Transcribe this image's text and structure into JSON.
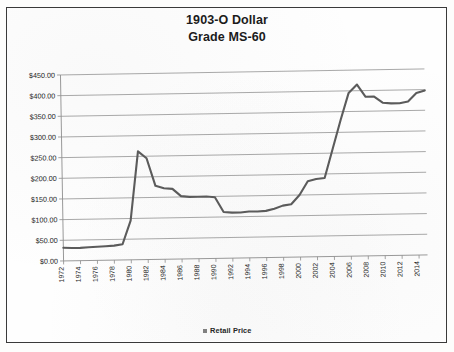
{
  "chart_data": {
    "type": "line",
    "title": "1903-O Dollar",
    "subtitle": "Grade MS-60",
    "xlabel": "",
    "ylabel": "",
    "ylim": [
      0,
      450
    ],
    "ytick_labels": [
      "$0.00",
      "$50.00",
      "$100.00",
      "$150.00",
      "$200.00",
      "$250.00",
      "$300.00",
      "$350.00",
      "$400.00",
      "$450.00"
    ],
    "ytick_values": [
      0,
      50,
      100,
      150,
      200,
      250,
      300,
      350,
      400,
      450
    ],
    "grid": true,
    "legend_position": "bottom",
    "xtick_labels": [
      "1972",
      "1974",
      "1976",
      "1978",
      "1980",
      "1982",
      "1984",
      "1986",
      "1988",
      "1990",
      "1992",
      "1994",
      "1996",
      "1998",
      "2000",
      "2002",
      "2004",
      "2006",
      "2008",
      "2010",
      "2012",
      "2014"
    ],
    "xlim": [
      1972,
      2015
    ],
    "series": [
      {
        "name": "Retail Price",
        "color": "#5b5b5b",
        "x": [
          1972,
          1973,
          1974,
          1975,
          1976,
          1977,
          1978,
          1979,
          1980,
          1981,
          1982,
          1983,
          1984,
          1985,
          1986,
          1987,
          1988,
          1989,
          1990,
          1991,
          1992,
          1993,
          1994,
          1995,
          1996,
          1997,
          1998,
          1999,
          2000,
          2001,
          2002,
          2003,
          2004,
          2005,
          2006,
          2007,
          2008,
          2009,
          2010,
          2011,
          2012,
          2013,
          2014,
          2015
        ],
        "values": [
          32,
          31,
          31,
          32,
          33,
          34,
          35,
          38,
          95,
          262,
          245,
          178,
          172,
          170,
          152,
          150,
          150,
          150,
          148,
          112,
          110,
          110,
          112,
          112,
          113,
          118,
          125,
          128,
          150,
          183,
          188,
          190,
          260,
          330,
          395,
          415,
          385,
          385,
          370,
          368,
          368,
          372,
          392,
          398
        ]
      }
    ],
    "legend": [
      {
        "label": "Retail Price",
        "color": "#808080"
      }
    ]
  }
}
